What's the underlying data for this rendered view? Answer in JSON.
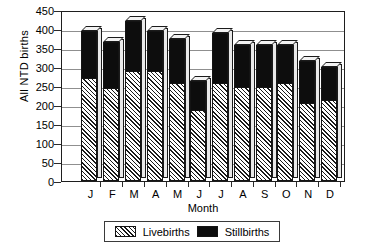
{
  "chart_data": {
    "type": "bar",
    "stacked": true,
    "title": "",
    "xlabel": "Month",
    "ylabel": "All  NTD births",
    "categories": [
      "J",
      "F",
      "M",
      "A",
      "M",
      "J",
      "J",
      "A",
      "S",
      "O",
      "N",
      "D"
    ],
    "category_full": [
      "January",
      "February",
      "March",
      "April",
      "May",
      "June",
      "July",
      "August",
      "September",
      "October",
      "November",
      "December"
    ],
    "series": [
      {
        "name": "Livebirths",
        "values": [
          272,
          245,
          290,
          290,
          257,
          188,
          258,
          248,
          248,
          257,
          205,
          213
        ]
      },
      {
        "name": "Stillbirths",
        "values": [
          123,
          120,
          130,
          105,
          118,
          74,
          132,
          109,
          109,
          100,
          110,
          87
        ]
      }
    ],
    "totals": [
      395,
      365,
      420,
      395,
      375,
      262,
      390,
      357,
      357,
      357,
      315,
      300
    ],
    "ylim": [
      0,
      450
    ],
    "ytick_step": 50,
    "yticks": [
      "450",
      "400",
      "350",
      "300",
      "250",
      "200",
      "150",
      "100",
      "50",
      "0"
    ],
    "grid": "horizontal",
    "legend_position": "bottom-center",
    "legend": [
      "Livebirths",
      "Stillbirths"
    ],
    "colors": {
      "livebirths": "#1a1a1a",
      "stillbirths": "#0d0d0d",
      "gridline": "#8f8f8f",
      "axis": "#1e1e1e",
      "background": "#ffffff"
    }
  }
}
